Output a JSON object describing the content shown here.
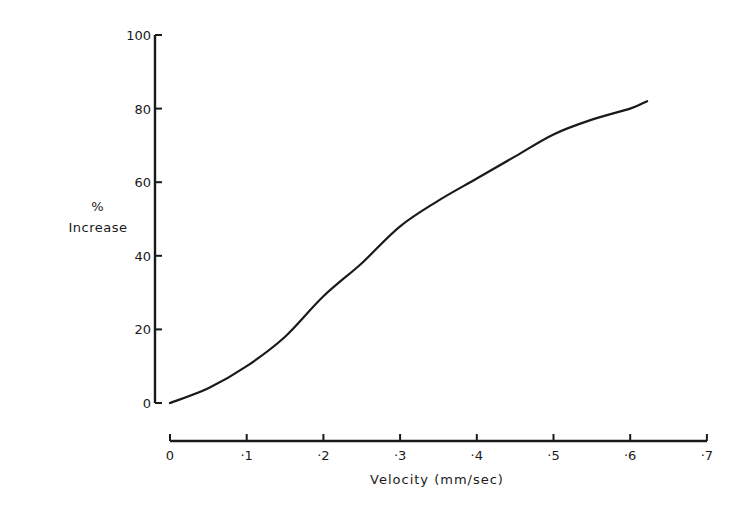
{
  "chart_data": {
    "type": "line",
    "title": "",
    "xlabel": "Velocity (mm/sec)",
    "ylabel_line1": "%",
    "ylabel_line2": "Increase",
    "xlim": [
      0,
      0.7
    ],
    "ylim": [
      0,
      100
    ],
    "grid": false,
    "legend": null,
    "x_ticks": [
      0,
      0.1,
      0.2,
      0.3,
      0.4,
      0.5,
      0.6,
      0.7
    ],
    "x_tick_labels": [
      "0",
      "·1",
      "·2",
      "·3",
      "·4",
      "·5",
      "·6",
      "·7"
    ],
    "y_ticks": [
      0,
      20,
      40,
      60,
      80,
      100
    ],
    "y_tick_labels": [
      "0",
      "20",
      "40",
      "60",
      "80",
      "100"
    ],
    "series": [
      {
        "name": "% Increase",
        "color": "#1a1a1a",
        "x": [
          0,
          0.05,
          0.1,
          0.15,
          0.2,
          0.25,
          0.3,
          0.35,
          0.4,
          0.45,
          0.5,
          0.55,
          0.6,
          0.622
        ],
        "values": [
          0,
          4,
          10,
          18,
          29,
          38,
          48,
          55,
          61,
          67,
          73,
          77,
          80,
          82
        ]
      }
    ]
  },
  "layout": {
    "y_axis": {
      "x": 155,
      "y_top": 35,
      "y_bottom": 403
    },
    "x_axis": {
      "y": 441,
      "x_left": 170,
      "x_right": 707
    },
    "plot_x0": 170,
    "plot_x_per_unit": 767,
    "plot_y0": 403,
    "plot_y_per_pct": 3.68
  }
}
